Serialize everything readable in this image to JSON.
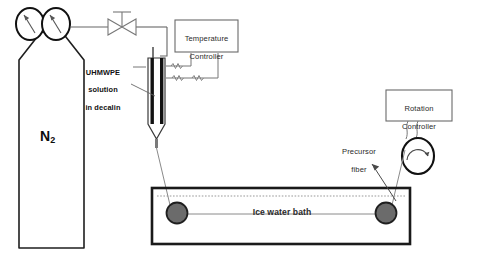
{
  "diagram": {
    "colors": {
      "line": "#555555",
      "heavy_line": "#1a1a1a",
      "heater_fill": "#111111",
      "roller_fill": "#6b6b6b",
      "roller_stroke": "#1f1f1f",
      "background": "#ffffff",
      "text": "#1a1a1a"
    },
    "gas_cylinder": {
      "name": "nitrogen-cylinder",
      "label": "N",
      "subscript": "2"
    },
    "gauges": [
      {
        "name": "pressure-gauge-left"
      },
      {
        "name": "pressure-gauge-right"
      }
    ],
    "valve": {
      "name": "gas-valve"
    },
    "temperature_controller": {
      "label_line1": "Temperature",
      "label_line2": "Controller"
    },
    "rotation_controller": {
      "label_line1": "Rotation",
      "label_line2": "Controller"
    },
    "solution_label": {
      "line1": "UHMWPE",
      "line2": "solution",
      "line3": "in decalin"
    },
    "precursor_label": {
      "line1": "Precursor",
      "line2": "fiber"
    },
    "bath": {
      "label": "Ice water bath"
    },
    "rollers": [
      {
        "name": "roller-left"
      },
      {
        "name": "roller-right"
      }
    ],
    "spool": {
      "name": "winding-spool"
    }
  }
}
